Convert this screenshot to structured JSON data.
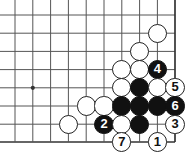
{
  "board": {
    "title": "Go board diagram",
    "line_color": "#555555",
    "edge_color": "#333333",
    "white_color": "#ffffff",
    "black_color": "#111111",
    "background": "#ffffff",
    "columns": 10,
    "rows": 8,
    "col_x": [
      15,
      32.8,
      50.6,
      68.4,
      86.2,
      104.0,
      121.8,
      139.6,
      157.4,
      175.0
    ],
    "row_y": [
      15,
      33.2,
      51.4,
      69.6,
      87.8,
      106.0,
      124.2,
      142.0
    ],
    "stone_radius": 9.6,
    "star_points": [
      {
        "col": 1,
        "row": 4
      }
    ],
    "edges": {
      "right": true,
      "bottom": true
    },
    "stones": [
      {
        "id": "w-a",
        "color": "white",
        "col": 8,
        "row": 1,
        "label": ""
      },
      {
        "id": "w-b",
        "color": "white",
        "col": 7,
        "row": 2,
        "label": ""
      },
      {
        "id": "w-c",
        "color": "white",
        "col": 6,
        "row": 3,
        "label": ""
      },
      {
        "id": "w-d",
        "color": "white",
        "col": 7,
        "row": 3,
        "label": ""
      },
      {
        "id": "b-4",
        "color": "black",
        "col": 8,
        "row": 3,
        "label": "4"
      },
      {
        "id": "w-e",
        "color": "white",
        "col": 6,
        "row": 4,
        "label": ""
      },
      {
        "id": "b-f",
        "color": "black",
        "col": 7,
        "row": 4,
        "label": ""
      },
      {
        "id": "w-g",
        "color": "white",
        "col": 8,
        "row": 4,
        "label": ""
      },
      {
        "id": "w-5",
        "color": "white",
        "col": 9,
        "row": 4,
        "label": "5"
      },
      {
        "id": "w-h",
        "color": "white",
        "col": 4,
        "row": 5,
        "label": ""
      },
      {
        "id": "w-i",
        "color": "white",
        "col": 5,
        "row": 5,
        "label": ""
      },
      {
        "id": "b-j",
        "color": "black",
        "col": 6,
        "row": 5,
        "label": ""
      },
      {
        "id": "b-k",
        "color": "black",
        "col": 7,
        "row": 5,
        "label": ""
      },
      {
        "id": "b-l",
        "color": "black",
        "col": 8,
        "row": 5,
        "label": ""
      },
      {
        "id": "b-6",
        "color": "black",
        "col": 9,
        "row": 5,
        "label": "6"
      },
      {
        "id": "w-m",
        "color": "white",
        "col": 3,
        "row": 6,
        "label": ""
      },
      {
        "id": "b-2",
        "color": "black",
        "col": 5,
        "row": 6,
        "label": "2"
      },
      {
        "id": "w-n",
        "color": "white",
        "col": 6,
        "row": 6,
        "label": ""
      },
      {
        "id": "b-o",
        "color": "black",
        "col": 7,
        "row": 6,
        "label": ""
      },
      {
        "id": "w-3",
        "color": "white",
        "col": 9,
        "row": 6,
        "label": "3"
      },
      {
        "id": "w-7",
        "color": "white",
        "col": 6,
        "row": 7,
        "label": "7"
      },
      {
        "id": "w-1",
        "color": "white",
        "col": 8,
        "row": 7,
        "label": "1"
      }
    ]
  }
}
